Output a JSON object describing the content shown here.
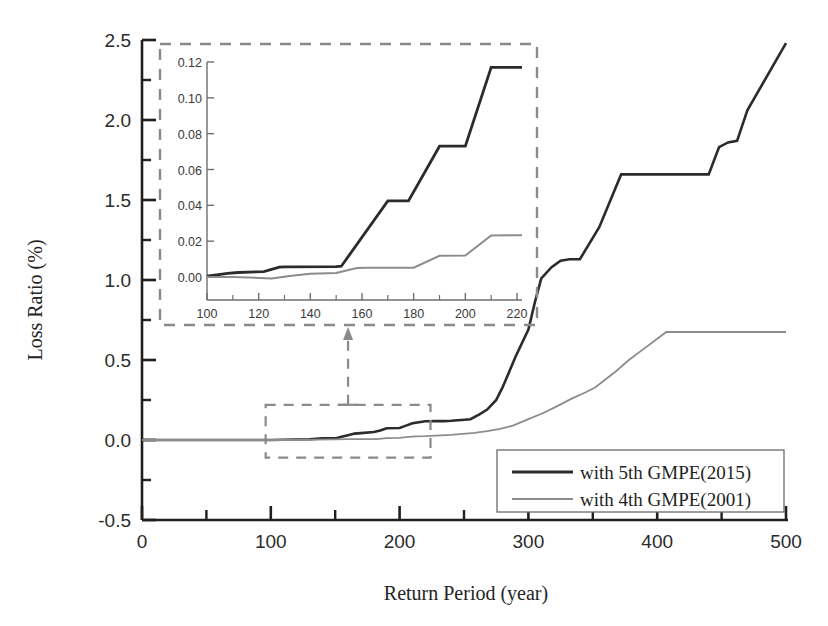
{
  "chart_data": {
    "type": "line",
    "title": "",
    "xlabel": "Return Period (year)",
    "ylabel": "Loss Ratio (%)",
    "xlim": [
      0,
      500
    ],
    "ylim": [
      -0.5,
      2.5
    ],
    "xticks": [
      0,
      100,
      200,
      300,
      400,
      500
    ],
    "yticks": [
      -0.5,
      0.0,
      0.5,
      1.0,
      1.5,
      2.0,
      2.5
    ],
    "xtick_labels": [
      "0",
      "100",
      "200",
      "300",
      "400",
      "500"
    ],
    "ytick_labels": [
      "-0.5",
      "0.0",
      "0.5",
      "1.0",
      "1.5",
      "2.0",
      "2.5"
    ],
    "grid": false,
    "legend_position": "lower right",
    "series": [
      {
        "name": "with 5th GMPE(2015)",
        "color": "#2b2b2b",
        "width": 2.6,
        "x": [
          0,
          60,
          100,
          130,
          140,
          150,
          155,
          160,
          165,
          170,
          180,
          185,
          190,
          200,
          205,
          210,
          220,
          228,
          235,
          240,
          248,
          255,
          262,
          268,
          275,
          280,
          290,
          300,
          305,
          310,
          318,
          325,
          332,
          340,
          355,
          372,
          378,
          385,
          440,
          448,
          455,
          462,
          470,
          500
        ],
        "y": [
          0.0,
          0.0,
          0.0,
          0.005,
          0.01,
          0.01,
          0.02,
          0.03,
          0.04,
          0.043,
          0.05,
          0.06,
          0.073,
          0.075,
          0.09,
          0.105,
          0.117,
          0.118,
          0.118,
          0.12,
          0.125,
          0.13,
          0.16,
          0.19,
          0.25,
          0.33,
          0.52,
          0.69,
          0.86,
          1.01,
          1.08,
          1.12,
          1.13,
          1.13,
          1.33,
          1.66,
          1.66,
          1.66,
          1.66,
          1.83,
          1.86,
          1.87,
          2.06,
          2.48
        ]
      },
      {
        "name": "with 4th GMPE(2001)",
        "color": "#8c8c8c",
        "width": 1.8,
        "x": [
          0,
          60,
          100,
          125,
          135,
          150,
          160,
          172,
          182,
          190,
          200,
          205,
          212,
          220,
          240,
          258,
          268,
          278,
          288,
          300,
          312,
          322,
          334,
          345,
          352,
          360,
          368,
          378,
          388,
          398,
          407,
          415,
          460,
          500
        ],
        "y": [
          0.0,
          0.0,
          0.0,
          0.0,
          0.002,
          0.004,
          0.006,
          0.006,
          0.006,
          0.012,
          0.013,
          0.018,
          0.023,
          0.024,
          0.032,
          0.045,
          0.055,
          0.07,
          0.09,
          0.13,
          0.17,
          0.21,
          0.26,
          0.3,
          0.33,
          0.38,
          0.43,
          0.5,
          0.56,
          0.62,
          0.675,
          0.675,
          0.675,
          0.675
        ]
      }
    ],
    "inset": {
      "xlim": [
        95,
        225
      ],
      "ylim": [
        -0.009,
        0.127
      ],
      "xticks": [
        100,
        120,
        140,
        160,
        180,
        200,
        220
      ],
      "yticks": [
        0.0,
        0.02,
        0.04,
        0.06,
        0.08,
        0.1,
        0.12
      ],
      "xtick_labels": [
        "100",
        "120",
        "140",
        "160",
        "180",
        "200",
        "220"
      ],
      "ytick_labels": [
        "0.00",
        "0.02",
        "0.04",
        "0.06",
        "0.08",
        "0.10",
        "0.12"
      ],
      "series": [
        {
          "name": "with 5th GMPE(2015)",
          "color": "#2b2b2b",
          "width": 2.8,
          "x": [
            98,
            108,
            112,
            122,
            128,
            130,
            150,
            152,
            170,
            178,
            190,
            200,
            210,
            222
          ],
          "y": [
            0.0,
            0.002,
            0.0025,
            0.003,
            0.0055,
            0.0057,
            0.0058,
            0.006,
            0.0425,
            0.0425,
            0.073,
            0.073,
            0.117,
            0.117
          ]
        },
        {
          "name": "with 4th GMPE(2001)",
          "color": "#8c8c8c",
          "width": 2.0,
          "x": [
            98,
            110,
            125,
            132,
            140,
            150,
            158,
            162,
            180,
            190,
            200,
            210,
            222
          ],
          "y": [
            0.0,
            0.0,
            -0.0008,
            0.0005,
            0.0018,
            0.0022,
            0.005,
            0.0052,
            0.0052,
            0.0118,
            0.012,
            0.0232,
            0.0233
          ]
        }
      ]
    },
    "annotations": [
      {
        "name": "zoom-source-rectangle",
        "x0": 96,
        "x1": 224,
        "y0": -0.11,
        "y1": 0.22
      },
      {
        "name": "zoom-connector-arrow",
        "from_x": 160,
        "from_y": 0.22,
        "to_x": 160,
        "to_y": 0.7
      }
    ]
  },
  "legend": {
    "entries": [
      {
        "label": "with 5th GMPE(2015)",
        "color": "#2b2b2b"
      },
      {
        "label": "with 4th GMPE(2001)",
        "color": "#8c8c8c"
      }
    ]
  },
  "colors": {
    "series_5th": "#2b2b2b",
    "series_4th": "#8c8c8c",
    "axis": "#1f1f1f",
    "dashed_box": "#8a8a8a",
    "background": "#ffffff"
  }
}
